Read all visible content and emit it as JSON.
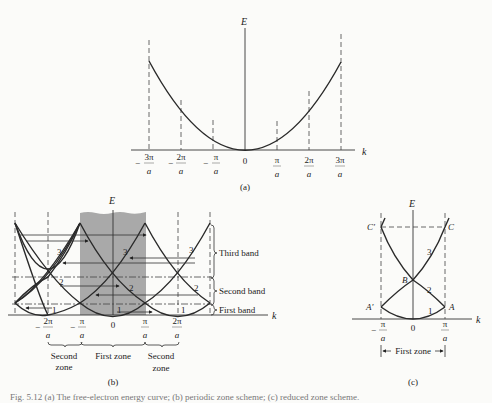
{
  "panels": {
    "a": {
      "label": "(a)",
      "y_axis_label": "E",
      "x_axis_label": "k",
      "ticks": [
        {
          "sign": "−",
          "num": "3π",
          "den": "a"
        },
        {
          "sign": "−",
          "num": "2π",
          "den": "a"
        },
        {
          "sign": "−",
          "num": "π",
          "den": "a"
        },
        {
          "sign": "",
          "num": "0",
          "den": ""
        },
        {
          "sign": "",
          "num": "π",
          "den": "a"
        },
        {
          "sign": "",
          "num": "2π",
          "den": "a"
        },
        {
          "sign": "",
          "num": "3π",
          "den": "a"
        }
      ]
    },
    "b": {
      "label": "(b)",
      "y_axis_label": "E",
      "x_axis_label": "k",
      "ticks": [
        {
          "sign": "−",
          "num": "2π",
          "den": "a"
        },
        {
          "sign": "−",
          "num": "π",
          "den": "a"
        },
        {
          "sign": "",
          "num": "0",
          "den": ""
        },
        {
          "sign": "",
          "num": "π",
          "den": "a"
        },
        {
          "sign": "",
          "num": "2π",
          "den": "a"
        }
      ],
      "band_numbers": [
        "1",
        "2",
        "3"
      ],
      "bands": [
        "Third band",
        "Second band",
        "First band"
      ],
      "zones": {
        "left_line1": "Second",
        "left_line2": "zone",
        "center": "First zone",
        "right_line1": "Second",
        "right_line2": "zone"
      },
      "shade_color": "#a9a9a9"
    },
    "c": {
      "label": "(c)",
      "y_axis_label": "E",
      "x_axis_label": "k",
      "ticks": [
        {
          "sign": "−",
          "num": "π",
          "den": "a"
        },
        {
          "sign": "",
          "num": "0",
          "den": ""
        },
        {
          "sign": "",
          "num": "π",
          "den": "a"
        }
      ],
      "points": {
        "A": "A",
        "A_prime": "A′",
        "B": "B",
        "C": "C",
        "C_prime": "C′"
      },
      "band_numbers": [
        "1",
        "2",
        "3"
      ],
      "zone_label": "First zone"
    }
  },
  "caption": "Fig. 5.12  (a) The free-electron energy curve; (b) periodic zone scheme; (c) reduced zone scheme."
}
